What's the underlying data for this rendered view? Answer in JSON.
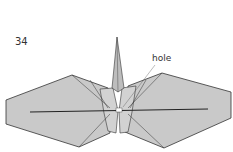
{
  "diagram": {
    "step_number": "34",
    "annotations": [
      {
        "text": "hole",
        "target": "center-hole"
      }
    ],
    "colors": {
      "paper": "#c8c8c8",
      "paper_light": "#d6d6d6",
      "outline": "#333333",
      "background": "#ffffff"
    }
  }
}
